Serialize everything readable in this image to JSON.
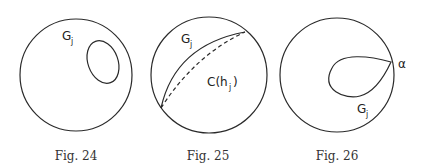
{
  "figures": [
    {
      "id": "fig24",
      "caption": "Fig. 24",
      "labels": {
        "main": "G",
        "main_sub": "j"
      }
    },
    {
      "id": "fig25",
      "caption": "Fig. 25",
      "labels": {
        "main": "G",
        "main_sub": "j",
        "curve": "C(h",
        "curve_sub": "j",
        "curve_close": ")"
      }
    },
    {
      "id": "fig26",
      "caption": "Fig. 26",
      "labels": {
        "main": "G",
        "main_sub": "j",
        "point": "α"
      }
    }
  ]
}
